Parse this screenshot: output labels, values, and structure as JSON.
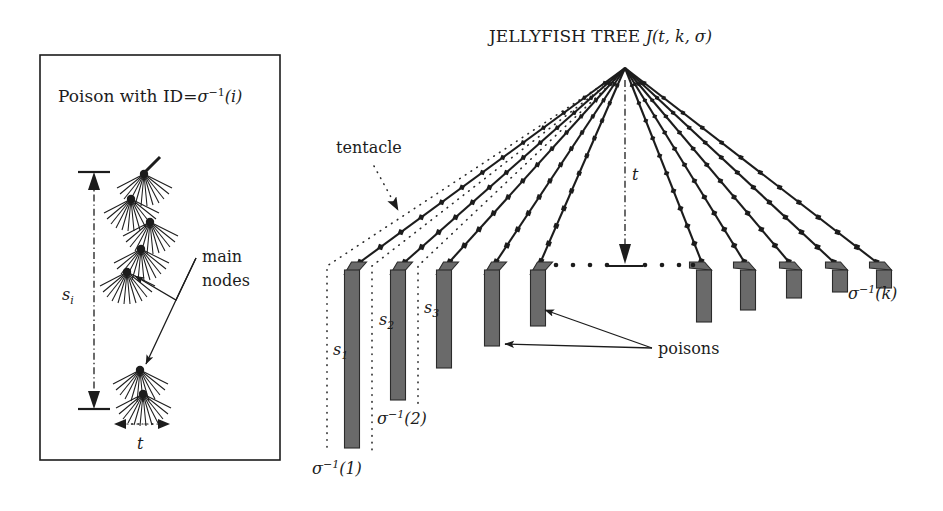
{
  "figure": {
    "width": 943,
    "height": 511,
    "background": "#ffffff",
    "ink_color": "#1c1c1c",
    "poison_fill": "#6a6a6a",
    "poison_stroke": "#2b2b2b"
  },
  "left_panel": {
    "name": "poison-detail-panel",
    "title_prefix": "Poison with ID=",
    "title_sigma": "σ",
    "title_sup": "−1",
    "title_arg": "(i)",
    "height_label_base": "s",
    "height_label_sub": "i",
    "width_label": "t",
    "annotation": {
      "line1": "main",
      "line2": "nodes"
    },
    "node_count": 6,
    "border": {
      "x": 40,
      "y": 55,
      "w": 240,
      "h": 405
    }
  },
  "main_figure": {
    "title_text": "JELLYFISH TREE ",
    "title_math_J": "J",
    "title_math_args": "(t, k, σ)",
    "apex": {
      "x": 625,
      "y": 68
    },
    "depth_label": "t",
    "tentacle_label": "tentacle",
    "poisons_label": "poisons",
    "ellipsis_dots": 9,
    "baseline_y": 265
  },
  "tentacles": [
    {
      "index": 1,
      "tip_x": 352,
      "tip_y": 268,
      "nodes": 13,
      "bar_top": 270,
      "bar_bottom": 448,
      "bar_w": 15,
      "label": "σ⁻¹(1)"
    },
    {
      "index": 2,
      "tip_x": 398,
      "tip_y": 268,
      "nodes": 13,
      "bar_top": 270,
      "bar_bottom": 400,
      "bar_w": 15,
      "label": "σ⁻¹(2)"
    },
    {
      "index": 3,
      "tip_x": 444,
      "tip_y": 268,
      "nodes": 12,
      "bar_top": 270,
      "bar_bottom": 368,
      "bar_w": 15,
      "label": ""
    },
    {
      "index": 4,
      "tip_x": 492,
      "tip_y": 268,
      "nodes": 12,
      "bar_top": 270,
      "bar_bottom": 346,
      "bar_w": 15,
      "label": ""
    },
    {
      "index": 5,
      "tip_x": 538,
      "tip_y": 268,
      "nodes": 11,
      "bar_top": 270,
      "bar_bottom": 326,
      "bar_w": 15,
      "label": ""
    },
    {
      "index": 6,
      "tip_x": 704,
      "tip_y": 268,
      "nodes": 11,
      "bar_top": 270,
      "bar_bottom": 322,
      "bar_w": 15,
      "label": ""
    },
    {
      "index": 7,
      "tip_x": 748,
      "tip_y": 268,
      "nodes": 12,
      "bar_top": 270,
      "bar_bottom": 310,
      "bar_w": 15,
      "label": ""
    },
    {
      "index": 8,
      "tip_x": 794,
      "tip_y": 268,
      "nodes": 12,
      "bar_top": 270,
      "bar_bottom": 298,
      "bar_w": 15,
      "label": ""
    },
    {
      "index": 9,
      "tip_x": 840,
      "tip_y": 268,
      "nodes": 13,
      "bar_top": 270,
      "bar_bottom": 292,
      "bar_w": 15,
      "label": ""
    },
    {
      "index": 10,
      "tip_x": 884,
      "tip_y": 268,
      "nodes": 13,
      "bar_top": 270,
      "bar_bottom": 288,
      "bar_w": 15,
      "label": "σ⁻¹(k)"
    }
  ],
  "span_labels": [
    {
      "name": "s1",
      "base": "s",
      "sub": "1",
      "x": 333,
      "y": 355
    },
    {
      "name": "s2",
      "base": "s",
      "sub": "2",
      "x": 379,
      "y": 325
    },
    {
      "name": "s3",
      "base": "s",
      "sub": "3",
      "x": 424,
      "y": 313
    }
  ],
  "sigma_labels": {
    "sigma": "σ",
    "sup": "−1",
    "arg1": "(1)",
    "arg2": "(2)",
    "argk": "(k)"
  }
}
